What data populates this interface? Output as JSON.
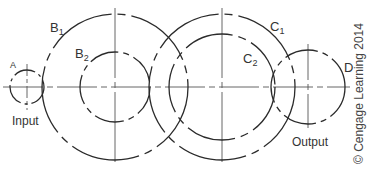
{
  "diagram": {
    "line_color": "#2b2b2b",
    "center_line_color": "#555555",
    "centerline_y": 87,
    "gears": [
      {
        "id": "A",
        "label": "A",
        "cx": 27,
        "cy": 87,
        "circles": [
          {
            "r": 17,
            "name": "A"
          }
        ]
      },
      {
        "id": "B",
        "label": "B1",
        "cx": 115,
        "cy": 87,
        "circles": [
          {
            "r": 73,
            "name": "B1"
          },
          {
            "r": 35,
            "name": "B2"
          }
        ]
      },
      {
        "id": "C",
        "label": "C1",
        "cx": 222,
        "cy": 87,
        "circles": [
          {
            "r": 73,
            "name": "C1"
          },
          {
            "r": 53,
            "name": "C2"
          }
        ]
      },
      {
        "id": "D",
        "label": "D",
        "cx": 308,
        "cy": 87,
        "circles": [
          {
            "r": 37,
            "name": "D"
          }
        ]
      }
    ],
    "labels": {
      "A": "A",
      "B1_main": "B",
      "B1_sub": "1",
      "B2_main": "B",
      "B2_sub": "2",
      "C1_main": "C",
      "C1_sub": "1",
      "C2_main": "C",
      "C2_sub": "2",
      "D": "D",
      "input": "Input",
      "output": "Output"
    },
    "copyright": "© Cengage Learning 2014"
  }
}
